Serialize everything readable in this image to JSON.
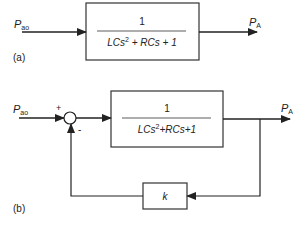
{
  "diagram": {
    "panel_a": {
      "label": "(a)",
      "input": {
        "symbol": "P",
        "subscript": "ao"
      },
      "output": {
        "symbol": "P",
        "subscript": "A"
      },
      "block": {
        "numerator": "1",
        "denominator": {
          "t1": "LCs",
          "exp": "2",
          "t2": " + RCs + 1"
        }
      }
    },
    "panel_b": {
      "label": "(b)",
      "input": {
        "symbol": "P",
        "subscript": "ao"
      },
      "output": {
        "symbol": "P",
        "subscript": "A"
      },
      "summing_junction": {
        "plus": "+",
        "minus": "-"
      },
      "forward_block": {
        "numerator": "1",
        "denominator": {
          "t1": "LCs",
          "exp": "2",
          "t2": "+RCs+1"
        }
      },
      "feedback_block": {
        "gain": "k"
      }
    },
    "colors": {
      "line": "#222222",
      "box": "#333333",
      "text": "#222222"
    }
  }
}
